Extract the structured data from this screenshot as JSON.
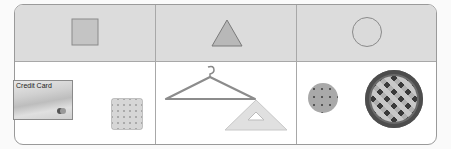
{
  "columns": [
    {
      "shape": "square",
      "shape_icon": "square-icon",
      "items": [
        {
          "name": "credit-card",
          "label": "Credit Card"
        },
        {
          "name": "cracker"
        }
      ]
    },
    {
      "shape": "triangle",
      "shape_icon": "triangle-icon",
      "items": [
        {
          "name": "clothes-hanger"
        },
        {
          "name": "set-square"
        }
      ]
    },
    {
      "shape": "circle",
      "shape_icon": "circle-icon",
      "items": [
        {
          "name": "cookie"
        },
        {
          "name": "pie"
        }
      ]
    }
  ],
  "colors": {
    "header_bg": "#dcdcdc",
    "border": "#9a9a9a",
    "shape_fill": "#c4c4c4",
    "shape_stroke": "#8a8a8a"
  }
}
